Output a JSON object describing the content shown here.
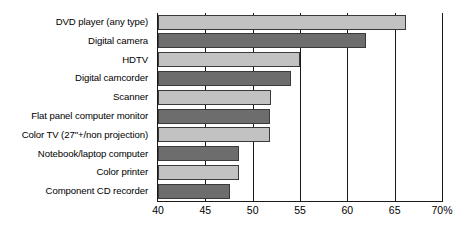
{
  "chart_data": {
    "type": "bar",
    "orientation": "horizontal",
    "title": "",
    "subtitle": "",
    "xlabel": "",
    "ylabel": "",
    "xlim": [
      40,
      70
    ],
    "xticks": [
      40,
      45,
      50,
      55,
      60,
      65,
      70
    ],
    "xtick_labels": [
      "40",
      "45",
      "50",
      "55",
      "60",
      "65",
      "70%"
    ],
    "grid": true,
    "legend": null,
    "categories": [
      "DVD player (any type)",
      "Digital camera",
      "HDTV",
      "Digital camcorder",
      "Scanner",
      "Flat panel computer monitor",
      "Color TV (27\"+/non projection)",
      "Notebook/laptop computer",
      "Color printer",
      "Component CD recorder"
    ],
    "values": [
      66.2,
      62.0,
      55.0,
      54.0,
      51.9,
      51.8,
      51.8,
      48.6,
      48.6,
      47.6
    ],
    "bar_colors": [
      "#c2c2c2",
      "#6d6d6d",
      "#c2c2c2",
      "#6d6d6d",
      "#c2c2c2",
      "#6d6d6d",
      "#c2c2c2",
      "#6d6d6d",
      "#c2c2c2",
      "#6d6d6d"
    ],
    "colors": {
      "light_bar": "#c2c2c2",
      "dark_bar": "#6d6d6d",
      "bar_outline": "#3a3a3a",
      "axis": "#1a1a1a",
      "background": "#ffffff",
      "text": "#000000"
    }
  }
}
